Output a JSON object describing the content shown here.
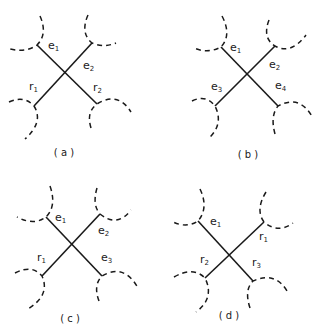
{
  "figure": {
    "panels": [
      {
        "id": "a",
        "caption": "( a )",
        "labels": {
          "top_left": {
            "base": "e",
            "sub": "1"
          },
          "top_right": {
            "base": "e",
            "sub": "2"
          },
          "bottom_left": {
            "base": "r",
            "sub": "1"
          },
          "bottom_right": {
            "base": "r",
            "sub": "2"
          }
        }
      },
      {
        "id": "b",
        "caption": "( b )",
        "labels": {
          "top_left": {
            "base": "e",
            "sub": "1"
          },
          "top_right": {
            "base": "e",
            "sub": "2"
          },
          "bottom_left": {
            "base": "e",
            "sub": "3"
          },
          "bottom_right": {
            "base": "e",
            "sub": "4"
          }
        }
      },
      {
        "id": "c",
        "caption": "( c )",
        "labels": {
          "top_left": {
            "base": "e",
            "sub": "1"
          },
          "top_right": {
            "base": "e",
            "sub": "2"
          },
          "bottom_left": {
            "base": "r",
            "sub": "1"
          },
          "bottom_right": {
            "base": "e",
            "sub": "3"
          }
        }
      },
      {
        "id": "d",
        "caption": "( d )",
        "labels": {
          "top_left": {
            "base": "e",
            "sub": "1"
          },
          "top_right": {
            "base": "r",
            "sub": "1"
          },
          "bottom_left": {
            "base": "r",
            "sub": "2"
          },
          "bottom_right": {
            "base": "r",
            "sub": "3"
          }
        }
      }
    ]
  }
}
